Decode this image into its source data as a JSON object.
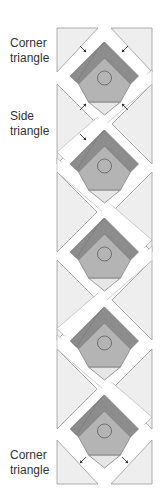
{
  "labels": {
    "corner_top_line1": "Corner",
    "corner_top_line2": "triangle",
    "side_line1": "Side",
    "side_line2": "triangle",
    "corner_bottom_line1": "Corner",
    "corner_bottom_line2": "triangle"
  },
  "colors": {
    "triangle_fill": "#eeeeee",
    "outline": "#999999",
    "roof_dark": "#8c8c8c",
    "house_fill": "#b4b4b4",
    "sashing_white": "#ffffff",
    "bottom_tip": "#e6e6e6"
  },
  "blocks": [
    {
      "cy": 78
    },
    {
      "cy": 166
    },
    {
      "cy": 254
    },
    {
      "cy": 343
    },
    {
      "cy": 431
    }
  ]
}
